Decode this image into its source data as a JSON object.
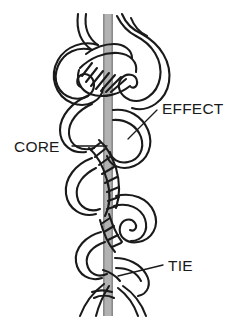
{
  "figure": {
    "type": "line-art-diagram",
    "background_color": "#ffffff",
    "ink_color": "#1a1a1a",
    "core_color": "#b0b0b0",
    "core_edge_color": "#8c8c8c"
  },
  "labels": {
    "effect": {
      "text": "EFFECT",
      "x": 162,
      "y": 114,
      "leader_from": [
        157,
        110
      ],
      "leader_to": [
        128,
        139
      ]
    },
    "core": {
      "text": "CORE",
      "x": 14,
      "y": 152,
      "leader_from": [
        72,
        146
      ],
      "leader_to": [
        107,
        146
      ]
    },
    "tie": {
      "text": "TIE",
      "x": 168,
      "y": 271,
      "leader_from": [
        163,
        265
      ],
      "leader_to": [
        118,
        276
      ]
    }
  },
  "core_bar": {
    "x": 103,
    "y_top": 14,
    "width": 10,
    "y_bottom": 316
  }
}
